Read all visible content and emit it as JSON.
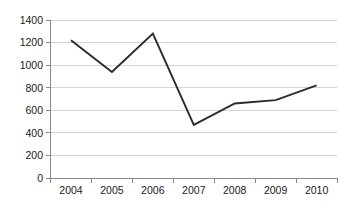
{
  "chart_data": {
    "type": "line",
    "title": "",
    "subtitle": "",
    "xlabel": "",
    "ylabel": "",
    "categories": [
      "2004",
      "2005",
      "2006",
      "2007",
      "2008",
      "2009",
      "2010"
    ],
    "x": [
      2004,
      2005,
      2006,
      2007,
      2008,
      2009,
      2010
    ],
    "series": [
      {
        "name": "",
        "values": [
          1220,
          940,
          1280,
          470,
          660,
          690,
          820
        ],
        "color": "#2b2b2b"
      }
    ],
    "values": [
      1220,
      940,
      1280,
      470,
      660,
      690,
      820
    ],
    "ylim": [
      0,
      1400
    ],
    "ytick_values": [
      0,
      200,
      400,
      600,
      800,
      1000,
      1200,
      1400
    ],
    "ytick_labels": [
      "0",
      "200",
      "400",
      "600",
      "800",
      "1000",
      "1200",
      "1400"
    ],
    "xtick_labels": [
      "2004",
      "2005",
      "2006",
      "2007",
      "2008",
      "2009",
      "2010"
    ],
    "grid": true,
    "grid_axis": "y",
    "legend": false,
    "legend_position": "none",
    "markers": false,
    "colors": {
      "line": "#2b2b2b",
      "grid": "#d4d4d4",
      "axis": "#8a8a8a",
      "text": "#1a1a1a",
      "background": "#ffffff"
    }
  },
  "axes": {
    "y_labels": {
      "t0": "0",
      "t200": "200",
      "t400": "400",
      "t600": "600",
      "t800": "800",
      "t1000": "1000",
      "t1200": "1200",
      "t1400": "1400"
    },
    "x_labels": {
      "y2004": "2004",
      "y2005": "2005",
      "y2006": "2006",
      "y2007": "2007",
      "y2008": "2008",
      "y2009": "2009",
      "y2010": "2010"
    }
  }
}
